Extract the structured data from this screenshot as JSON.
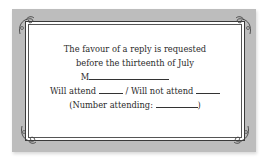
{
  "card": {
    "background_color": "#bdbdbd",
    "panel_color": "#ffffff",
    "lines": [
      "The favour of a reply is requested",
      "before the thirteenth of July"
    ],
    "name_prefix": "M",
    "attend_label": "Will attend",
    "separator": "/",
    "not_attend_label": "Will not attend",
    "number_open": "(Number attending:",
    "number_close": ")"
  }
}
